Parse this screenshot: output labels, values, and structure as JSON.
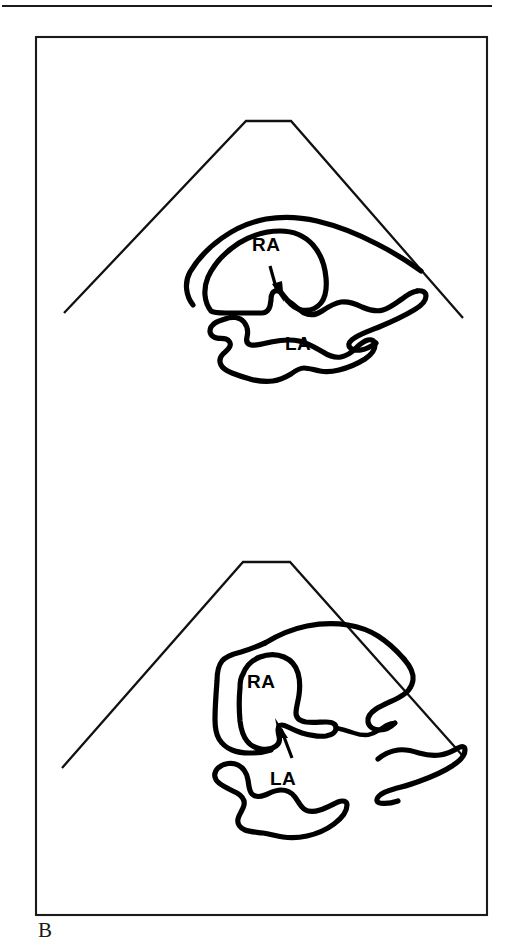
{
  "figure": {
    "panel_letter": "B",
    "ink_color": "#000000",
    "background_color": "#ffffff",
    "rule_color": "#1a1a1a",
    "frame": {
      "x": 36,
      "y": 37,
      "width": 451,
      "height": 878
    },
    "top_rule": {
      "x1": 2,
      "y1": 6,
      "x2": 492,
      "y2": 6
    },
    "panels": [
      {
        "id": "upper-panel",
        "name": "upper-sector-scan",
        "sector": {
          "apex_left_x": 246,
          "apex_left_y": 121,
          "apex_right_x": 291,
          "apex_right_y": 121,
          "left_base_x": 64,
          "left_base_y": 313,
          "right_base_x": 463,
          "right_base_y": 318
        },
        "labels": [
          {
            "text": "RA",
            "name": "label-right-atrium",
            "x": 264,
            "y": 245
          },
          {
            "text": "LA",
            "name": "label-left-atrium",
            "x": 292,
            "y": 343
          }
        ],
        "arrow": {
          "name": "defect-arrow",
          "tail_x": 272,
          "tail_y": 270,
          "tip_x": 280,
          "tip_y": 299,
          "points_to": "interatrial septum defect"
        }
      },
      {
        "id": "lower-panel",
        "name": "lower-sector-scan",
        "sector": {
          "apex_left_x": 243,
          "apex_left_y": 562,
          "apex_right_x": 290,
          "apex_right_y": 562,
          "left_base_x": 62,
          "left_base_y": 768,
          "right_base_x": 462,
          "right_base_y": 755
        },
        "labels": [
          {
            "text": "RA",
            "name": "label-right-atrium",
            "x": 258,
            "y": 682
          },
          {
            "text": "LA",
            "name": "label-left-atrium",
            "x": 280,
            "y": 778
          }
        ],
        "arrow": {
          "name": "defect-arrow",
          "tail_x": 290,
          "tail_y": 750,
          "tip_x": 278,
          "tip_y": 723,
          "points_to": "interatrial septum defect"
        }
      }
    ]
  }
}
